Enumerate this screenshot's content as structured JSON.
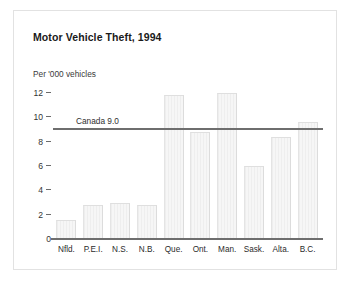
{
  "chart_data": {
    "type": "bar",
    "title": "Motor Vehicle Theft, 1994",
    "xlabel": "",
    "ylabel": "Per '000 vehicles",
    "ylim": [
      0,
      12
    ],
    "yticks": [
      "12",
      "10",
      "8",
      "6",
      "4",
      "2",
      "0"
    ],
    "ytick_values": [
      12,
      10,
      8,
      6,
      4,
      2,
      0
    ],
    "grid": false,
    "legend": "none",
    "categories": [
      "Nfld.",
      "P.E.I.",
      "N.S.",
      "N.B.",
      "Que.",
      "Ont.",
      "Man.",
      "Sask.",
      "Alta.",
      "B.C."
    ],
    "values": [
      1.6,
      2.8,
      3.0,
      2.8,
      11.8,
      8.8,
      12.0,
      6.0,
      8.4,
      9.6
    ],
    "reference_line": {
      "label": "Canada 9.0",
      "value": 9.0
    },
    "colors": {
      "bar_fill": "#f2f2f2",
      "bar_edge": "#e0e0e0",
      "axis_line": "#6e6e6e",
      "reference_line": "#6e6e6e",
      "text": "#2b2b2b",
      "frame": "#e2e2e2",
      "background": "#ffffff"
    }
  }
}
